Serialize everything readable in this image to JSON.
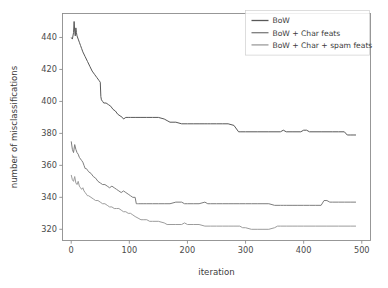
{
  "figure": {
    "background": "#ffffff",
    "width": 388,
    "height": 288
  },
  "chart_data": {
    "type": "line",
    "title": "",
    "xlabel": "iteration",
    "ylabel": "number of misclassifications",
    "xlim": [
      -15,
      515
    ],
    "ylim": [
      313,
      455
    ],
    "xticks": [
      0,
      100,
      200,
      300,
      400,
      500
    ],
    "xticklabels": [
      "0",
      "100",
      "200",
      "300",
      "400",
      "500"
    ],
    "yticks": [
      320,
      340,
      360,
      380,
      400,
      420,
      440
    ],
    "yticklabels": [
      "320",
      "340",
      "360",
      "380",
      "400",
      "420",
      "440"
    ],
    "grid": false,
    "legend_position": "upper right",
    "series": [
      {
        "name": "BoW",
        "color": "#585858",
        "x": [
          0,
          2,
          4,
          5,
          6,
          7,
          8,
          9,
          10,
          12,
          14,
          16,
          18,
          20,
          24,
          28,
          32,
          36,
          40,
          44,
          46,
          48,
          50,
          51,
          52,
          54,
          56,
          60,
          64,
          68,
          72,
          76,
          80,
          84,
          88,
          90,
          94,
          98,
          102,
          110,
          120,
          130,
          140,
          150,
          160,
          165,
          170,
          180,
          190,
          200,
          210,
          220,
          230,
          235,
          240,
          250,
          260,
          270,
          280,
          288,
          292,
          300,
          320,
          340,
          360,
          365,
          370,
          380,
          395,
          400,
          405,
          410,
          430,
          450,
          460,
          470,
          475,
          480,
          485,
          490
        ],
        "values": [
          440,
          439,
          443,
          450,
          444,
          441,
          446,
          443,
          441,
          439,
          437,
          435,
          433,
          431,
          428,
          425,
          422,
          419,
          417,
          415,
          414,
          413,
          412,
          403,
          401,
          400,
          399,
          399,
          398,
          397,
          395,
          394,
          392,
          391,
          390,
          389,
          390,
          390,
          390,
          390,
          390,
          390,
          390,
          390,
          389,
          388,
          387,
          387,
          386,
          386,
          386,
          386,
          386,
          386,
          386,
          386,
          386,
          386,
          385,
          381,
          381,
          381,
          381,
          381,
          381,
          382,
          381,
          381,
          381,
          382,
          382,
          381,
          381,
          381,
          381,
          381,
          379,
          379,
          379,
          379
        ]
      },
      {
        "name": "BoW + Char feats",
        "color": "#7d7d7d",
        "x": [
          0,
          2,
          4,
          6,
          8,
          10,
          12,
          14,
          16,
          18,
          20,
          22,
          24,
          26,
          28,
          30,
          34,
          38,
          42,
          46,
          50,
          54,
          58,
          62,
          66,
          70,
          74,
          78,
          82,
          86,
          90,
          94,
          98,
          102,
          106,
          110,
          112,
          114,
          116,
          120,
          125,
          130,
          140,
          150,
          160,
          170,
          180,
          190,
          195,
          200,
          210,
          220,
          230,
          235,
          240,
          250,
          260,
          270,
          280,
          290,
          300,
          310,
          320,
          330,
          340,
          350,
          360,
          365,
          370,
          380,
          390,
          400,
          410,
          420,
          430,
          435,
          440,
          445,
          450,
          460,
          470,
          480,
          490
        ],
        "values": [
          375,
          370,
          368,
          373,
          370,
          368,
          367,
          365,
          364,
          363,
          362,
          360,
          358,
          358,
          357,
          356,
          355,
          353,
          352,
          350,
          349,
          348,
          348,
          347,
          346,
          347,
          346,
          345,
          344,
          343,
          344,
          343,
          342,
          341,
          340,
          340,
          336,
          336,
          336,
          336,
          336,
          336,
          336,
          336,
          336,
          336,
          337,
          337,
          336,
          336,
          336,
          336,
          337,
          336,
          336,
          336,
          336,
          336,
          336,
          336,
          336,
          336,
          336,
          336,
          336,
          335,
          335,
          335,
          335,
          335,
          335,
          335,
          335,
          335,
          335,
          338,
          338,
          337,
          337,
          337,
          337,
          337,
          337
        ]
      },
      {
        "name": "BoW + Char + spam feats",
        "color": "#9c9c9c",
        "x": [
          0,
          2,
          4,
          6,
          8,
          10,
          12,
          14,
          16,
          18,
          20,
          22,
          24,
          26,
          28,
          30,
          34,
          38,
          42,
          46,
          50,
          54,
          58,
          62,
          66,
          70,
          74,
          78,
          82,
          86,
          90,
          94,
          98,
          102,
          106,
          110,
          115,
          120,
          125,
          130,
          135,
          140,
          150,
          160,
          165,
          170,
          180,
          190,
          195,
          200,
          210,
          220,
          230,
          240,
          250,
          260,
          270,
          280,
          290,
          295,
          300,
          310,
          320,
          330,
          340,
          350,
          355,
          360,
          370,
          380,
          390,
          400,
          420,
          440,
          460,
          480,
          490
        ],
        "values": [
          354,
          351,
          350,
          353,
          349,
          348,
          350,
          347,
          346,
          345,
          346,
          344,
          343,
          342,
          341,
          341,
          340,
          339,
          338,
          338,
          337,
          336,
          336,
          335,
          334,
          334,
          333,
          333,
          333,
          332,
          331,
          331,
          330,
          330,
          329,
          328,
          327,
          326,
          326,
          326,
          325,
          325,
          325,
          324,
          323,
          323,
          323,
          323,
          324,
          323,
          323,
          323,
          322,
          322,
          322,
          322,
          322,
          322,
          322,
          321,
          321,
          320,
          320,
          320,
          320,
          321,
          322,
          322,
          322,
          322,
          322,
          322,
          322,
          322,
          322,
          322,
          322
        ]
      }
    ]
  }
}
